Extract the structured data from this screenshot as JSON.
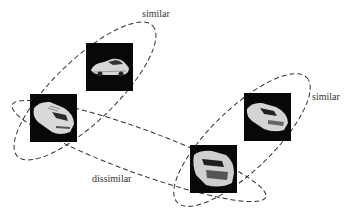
{
  "diagram": {
    "labels": {
      "similar_top": "similar",
      "similar_right": "similar",
      "dissimilar": "dissimilar"
    },
    "images": [
      {
        "name": "car-image-1",
        "x": 86,
        "y": 43,
        "orientation": "side-rear view facing left"
      },
      {
        "name": "car-image-2",
        "x": 30,
        "y": 94,
        "orientation": "rear three-quarter view"
      },
      {
        "name": "car-image-3",
        "x": 244,
        "y": 93,
        "orientation": "front three-quarter view"
      },
      {
        "name": "car-image-4",
        "x": 190,
        "y": 145,
        "orientation": "front view"
      }
    ],
    "groups": [
      {
        "name": "similar-group-left",
        "relation": "similar",
        "members": [
          1,
          2
        ]
      },
      {
        "name": "similar-group-right",
        "relation": "similar",
        "members": [
          3,
          4
        ]
      },
      {
        "name": "dissimilar-group",
        "relation": "dissimilar",
        "members": [
          2,
          4
        ]
      }
    ],
    "colors": {
      "line": "#333333",
      "image_bg": "#080808",
      "car": "#dcdcdc"
    }
  }
}
